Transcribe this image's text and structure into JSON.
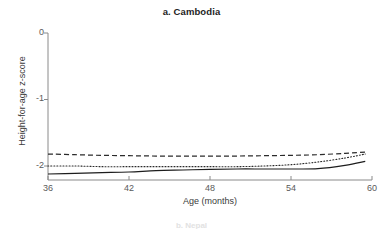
{
  "chart_data": {
    "type": "line",
    "title": "a. Cambodia",
    "xlabel": "Age (months)",
    "ylabel": "Height-for-age z-score",
    "xlim": [
      36,
      60
    ],
    "ylim": [
      -2.25,
      0
    ],
    "xticks": [
      36,
      42,
      48,
      54,
      60
    ],
    "yticks": [
      0,
      -1,
      -2
    ],
    "xtick_labels": [
      "36",
      "42",
      "48",
      "54",
      "60"
    ],
    "ytick_labels": [
      "0",
      "-1",
      "-2"
    ],
    "grid": false,
    "legend": "none",
    "x": [
      36,
      38,
      40,
      42,
      44,
      46,
      48,
      50,
      52,
      54,
      56,
      58,
      59.5
    ],
    "series": [
      {
        "name": "dashed-curve",
        "style": "dashed",
        "color": "#2b2b2b",
        "values": [
          -1.82,
          -1.83,
          -1.84,
          -1.845,
          -1.85,
          -1.85,
          -1.85,
          -1.85,
          -1.845,
          -1.84,
          -1.83,
          -1.81,
          -1.79
        ]
      },
      {
        "name": "dotted-curve",
        "style": "dotted",
        "color": "#2b2b2b",
        "values": [
          -2.0,
          -2.0,
          -2.01,
          -2.01,
          -2.01,
          -2.01,
          -2.01,
          -2.01,
          -2.0,
          -1.98,
          -1.94,
          -1.88,
          -1.82
        ]
      },
      {
        "name": "solid-curve",
        "style": "solid",
        "color": "#1d1d1d",
        "values": [
          -2.12,
          -2.11,
          -2.1,
          -2.09,
          -2.07,
          -2.06,
          -2.05,
          -2.045,
          -2.045,
          -2.045,
          -2.04,
          -1.99,
          -1.93
        ]
      }
    ]
  },
  "figure": {
    "title": "a. Cambodia",
    "ylabel": "Height-for-age z-score",
    "xlabel": "Age (months)",
    "ytick_labels": [
      "0",
      "-1",
      "-2"
    ],
    "xtick_labels": [
      "36",
      "42",
      "48",
      "54",
      "60"
    ],
    "next_panel_partial": "b. Nepal"
  }
}
